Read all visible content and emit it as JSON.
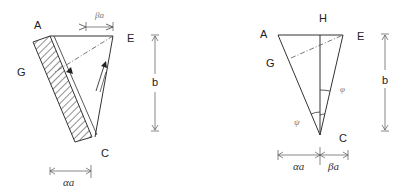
{
  "left_figure": {
    "labels": {
      "A": "A",
      "E": "E",
      "G": "G",
      "C": "C",
      "b": "b",
      "beta_a": "βa",
      "alpha_a": "αa"
    }
  },
  "right_figure": {
    "labels": {
      "A": "A",
      "H": "H",
      "E": "E",
      "G": "G",
      "C": "C",
      "b": "b",
      "phi": "φ",
      "psi": "ψ",
      "alpha_a": "αa",
      "beta_a": "βa"
    }
  }
}
